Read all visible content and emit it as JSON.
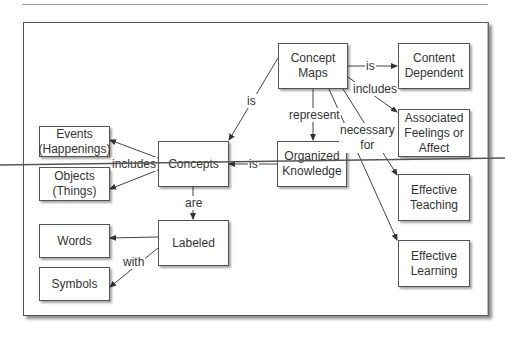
{
  "diagram": {
    "type": "concept-map",
    "nodes": {
      "concept_maps": "Concept\nMaps",
      "content_dependent": "Content\nDependent",
      "associated_feelings": "Associated\nFeelings or\nAffect",
      "organized_knowledge": "Organized\nKnowledge",
      "effective_teaching": "Effective\nTeaching",
      "effective_learning": "Effective\nLearning",
      "concepts": "Concepts",
      "events": "Events\n(Happenings)",
      "objects": "Objects\n(Things)",
      "labeled": "Labeled",
      "words": "Words",
      "symbols": "Symbols"
    },
    "links": {
      "cm_content": "is",
      "cm_feelings": "includes",
      "cm_concepts": "is",
      "cm_organized": "represent",
      "cm_effective": "necessary\nfor",
      "ok_concepts": "is",
      "concepts_events_objects": "includes",
      "concepts_labeled": "are",
      "labeled_words_symbols": "with"
    },
    "edges": [
      {
        "from": "Concept Maps",
        "to": "Content Dependent",
        "label": "is"
      },
      {
        "from": "Concept Maps",
        "to": "Associated Feelings or Affect",
        "label": "includes"
      },
      {
        "from": "Concept Maps",
        "to": "Concepts",
        "label": "is"
      },
      {
        "from": "Concept Maps",
        "to": "Organized Knowledge",
        "label": "represent"
      },
      {
        "from": "Concept Maps",
        "to": "Effective Teaching",
        "label": "necessary for"
      },
      {
        "from": "Concept Maps",
        "to": "Effective Learning",
        "label": "necessary for"
      },
      {
        "from": "Organized Knowledge",
        "to": "Concepts",
        "label": "is"
      },
      {
        "from": "Concepts",
        "to": "Events (Happenings)",
        "label": "includes"
      },
      {
        "from": "Concepts",
        "to": "Objects (Things)",
        "label": "includes"
      },
      {
        "from": "Concepts",
        "to": "Labeled",
        "label": "are"
      },
      {
        "from": "Labeled",
        "to": "Words",
        "label": "with"
      },
      {
        "from": "Labeled",
        "to": "Symbols",
        "label": "with"
      }
    ]
  }
}
